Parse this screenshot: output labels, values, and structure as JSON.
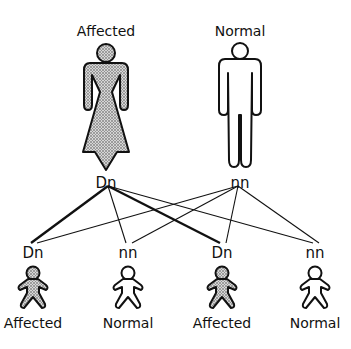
{
  "diagram": {
    "type": "pedigree-inheritance",
    "parents": [
      {
        "id": "mother",
        "label": "Affected",
        "genotype": "Dn",
        "sex": "female",
        "status": "affected"
      },
      {
        "id": "father",
        "label": "Normal",
        "genotype": "nn",
        "sex": "male",
        "status": "normal"
      }
    ],
    "children": [
      {
        "id": "child1",
        "genotype": "Dn",
        "label": "Affected",
        "status": "affected"
      },
      {
        "id": "child2",
        "genotype": "nn",
        "label": "Normal",
        "status": "normal"
      },
      {
        "id": "child3",
        "genotype": "Dn",
        "label": "Affected",
        "status": "affected"
      },
      {
        "id": "child4",
        "genotype": "nn",
        "label": "Normal",
        "status": "normal"
      }
    ],
    "links": [
      {
        "from": "mother",
        "to": "child1",
        "weight": "thick"
      },
      {
        "from": "mother",
        "to": "child2",
        "weight": "thin"
      },
      {
        "from": "mother",
        "to": "child3",
        "weight": "thick"
      },
      {
        "from": "mother",
        "to": "child4",
        "weight": "thin"
      },
      {
        "from": "father",
        "to": "child1",
        "weight": "thin"
      },
      {
        "from": "father",
        "to": "child2",
        "weight": "thin"
      },
      {
        "from": "father",
        "to": "child3",
        "weight": "thin"
      },
      {
        "from": "father",
        "to": "child4",
        "weight": "thin"
      }
    ],
    "colors": {
      "affected_fill": "#9a9a9a",
      "outline": "#111111",
      "background": "#ffffff"
    }
  }
}
